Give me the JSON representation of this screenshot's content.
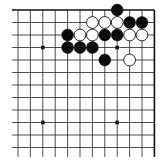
{
  "board": {
    "description": "Partial Go board diagram, top-right corner view",
    "columns": 12,
    "rows": 12,
    "origin_x": 18,
    "origin_y": 10,
    "spacing_x": 12.4,
    "spacing_y": 12.5,
    "bottom_extend": 157,
    "right_edge_col": 11,
    "top_edge_row": 0,
    "line_color": "#222222",
    "edge_color": "#111111",
    "star_points": [
      [
        2,
        3
      ],
      [
        8,
        3
      ],
      [
        2,
        9
      ],
      [
        8,
        9
      ]
    ],
    "stones": [
      {
        "color": "black",
        "col": 8,
        "row": 0
      },
      {
        "color": "white",
        "col": 6,
        "row": 1
      },
      {
        "color": "white",
        "col": 7,
        "row": 1
      },
      {
        "color": "white",
        "col": 8,
        "row": 1
      },
      {
        "color": "black",
        "col": 9,
        "row": 1
      },
      {
        "color": "black",
        "col": 10,
        "row": 1
      },
      {
        "color": "black",
        "col": 4,
        "row": 2
      },
      {
        "color": "white",
        "col": 5,
        "row": 2
      },
      {
        "color": "white",
        "col": 6,
        "row": 2
      },
      {
        "color": "black",
        "col": 7,
        "row": 2
      },
      {
        "color": "black",
        "col": 8,
        "row": 2
      },
      {
        "color": "white",
        "col": 9,
        "row": 2
      },
      {
        "color": "white",
        "col": 10,
        "row": 2
      },
      {
        "color": "black",
        "col": 4,
        "row": 3
      },
      {
        "color": "black",
        "col": 5,
        "row": 3
      },
      {
        "color": "black",
        "col": 6,
        "row": 3
      },
      {
        "color": "black",
        "col": 7,
        "row": 4
      },
      {
        "color": "white",
        "col": 9,
        "row": 4
      }
    ]
  }
}
